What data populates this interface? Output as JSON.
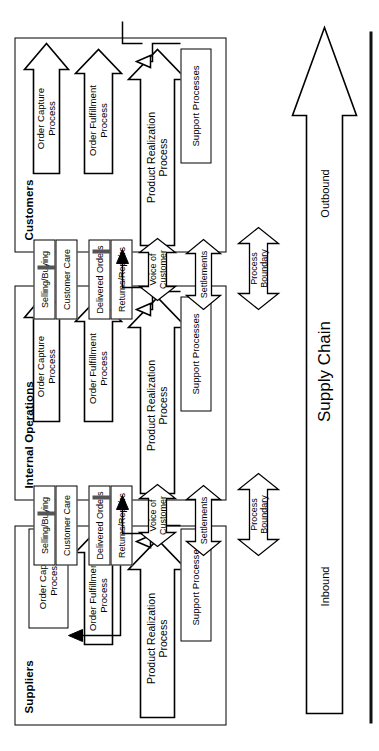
{
  "diagram": {
    "type": "process-flow-diagram",
    "orientation": "rotated-90-ccw"
  },
  "panels": [
    {
      "id": "suppliers",
      "label": "Suppliers"
    },
    {
      "id": "internal",
      "label": "Internal Operations"
    },
    {
      "id": "customers",
      "label": "Customers"
    }
  ],
  "processes": {
    "product_realization": "Product Realization\nProcess",
    "order_fulfillment": "Order Fulfillment\nProcess",
    "order_capture": "Order Capture\nProcess",
    "support_processes": "Support Processes"
  },
  "flows": {
    "voice_of_customer": "Voice of Customer",
    "delivered_orders": "Delivered Orders",
    "returns_repairs": "Returns/Repairs",
    "selling_buying": "Selling/Buying",
    "customer_care": "Customer Care",
    "settlements": "Settlements",
    "process_boundary": "Process\nBoundary"
  },
  "supply_chain": {
    "label": "Supply Chain",
    "inbound": "Inbound",
    "outbound": "Outbound"
  },
  "colors": {
    "stroke": "#000000",
    "fill": "#ffffff",
    "rule": "#111111",
    "background": "#ffffff"
  }
}
